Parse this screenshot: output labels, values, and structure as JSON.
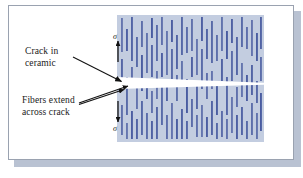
{
  "figure": {
    "type": "technical-illustration",
    "background_color": "#ffffff",
    "frame": {
      "border_color": "#9aa2b0",
      "shadow_color": "#b9c2d2"
    }
  },
  "labels": {
    "crack": {
      "line1": "Crack in",
      "line2": "ceramic"
    },
    "fibers": {
      "line1": "Fibers extend",
      "line2": "across crack"
    }
  },
  "stress_markers": {
    "top": {
      "symbol": "σ",
      "direction": "up",
      "meaning": "applied tensile stress"
    },
    "bottom": {
      "symbol": "σ",
      "direction": "down",
      "meaning": "applied tensile stress"
    }
  },
  "composite_block": {
    "matrix_color": "#c3cde0",
    "fiber_color": "#42559c",
    "fiber_orientation": "vertical",
    "crack_color": "#ffffff",
    "crack_shape": "wedge tapering left-to-right",
    "fibers": [
      {
        "x": 4,
        "y": 3,
        "h": 34
      },
      {
        "x": 4,
        "y": 44,
        "h": 26
      },
      {
        "x": 4,
        "y": 90,
        "h": 30
      },
      {
        "x": 9,
        "y": 14,
        "h": 22
      },
      {
        "x": 9,
        "y": 62,
        "h": 38
      },
      {
        "x": 9,
        "y": 108,
        "h": 16
      },
      {
        "x": 14,
        "y": 2,
        "h": 44
      },
      {
        "x": 14,
        "y": 52,
        "h": 20
      },
      {
        "x": 14,
        "y": 96,
        "h": 28
      },
      {
        "x": 19,
        "y": 22,
        "h": 30
      },
      {
        "x": 19,
        "y": 70,
        "h": 24
      },
      {
        "x": 19,
        "y": 104,
        "h": 20
      },
      {
        "x": 24,
        "y": 6,
        "h": 26
      },
      {
        "x": 24,
        "y": 40,
        "h": 36
      },
      {
        "x": 24,
        "y": 86,
        "h": 34
      },
      {
        "x": 29,
        "y": 18,
        "h": 40
      },
      {
        "x": 29,
        "y": 66,
        "h": 18
      },
      {
        "x": 29,
        "y": 98,
        "h": 26
      },
      {
        "x": 34,
        "y": 3,
        "h": 20
      },
      {
        "x": 34,
        "y": 30,
        "h": 32
      },
      {
        "x": 34,
        "y": 76,
        "h": 22
      },
      {
        "x": 34,
        "y": 106,
        "h": 18
      },
      {
        "x": 39,
        "y": 10,
        "h": 36
      },
      {
        "x": 39,
        "y": 56,
        "h": 28
      },
      {
        "x": 39,
        "y": 92,
        "h": 32
      },
      {
        "x": 44,
        "y": 2,
        "h": 28
      },
      {
        "x": 44,
        "y": 38,
        "h": 24
      },
      {
        "x": 44,
        "y": 70,
        "h": 40
      },
      {
        "x": 49,
        "y": 16,
        "h": 44
      },
      {
        "x": 49,
        "y": 66,
        "h": 20
      },
      {
        "x": 49,
        "y": 100,
        "h": 24
      },
      {
        "x": 54,
        "y": 5,
        "h": 22
      },
      {
        "x": 54,
        "y": 34,
        "h": 30
      },
      {
        "x": 54,
        "y": 88,
        "h": 36
      },
      {
        "x": 59,
        "y": 20,
        "h": 34
      },
      {
        "x": 59,
        "y": 60,
        "h": 26
      },
      {
        "x": 59,
        "y": 104,
        "h": 20
      },
      {
        "x": 64,
        "y": 2,
        "h": 38
      },
      {
        "x": 64,
        "y": 46,
        "h": 22
      },
      {
        "x": 64,
        "y": 94,
        "h": 30
      },
      {
        "x": 69,
        "y": 12,
        "h": 26
      },
      {
        "x": 69,
        "y": 64,
        "h": 34
      },
      {
        "x": 69,
        "y": 106,
        "h": 18
      },
      {
        "x": 74,
        "y": 4,
        "h": 32
      },
      {
        "x": 74,
        "y": 42,
        "h": 20
      },
      {
        "x": 74,
        "y": 84,
        "h": 28
      },
      {
        "x": 79,
        "y": 24,
        "h": 36
      },
      {
        "x": 79,
        "y": 70,
        "h": 24
      },
      {
        "x": 79,
        "y": 100,
        "h": 22
      },
      {
        "x": 84,
        "y": 2,
        "h": 24
      },
      {
        "x": 84,
        "y": 34,
        "h": 40
      },
      {
        "x": 84,
        "y": 90,
        "h": 32
      },
      {
        "x": 89,
        "y": 14,
        "h": 30
      },
      {
        "x": 89,
        "y": 58,
        "h": 26
      },
      {
        "x": 89,
        "y": 102,
        "h": 20
      },
      {
        "x": 94,
        "y": 6,
        "h": 42
      },
      {
        "x": 94,
        "y": 56,
        "h": 18
      },
      {
        "x": 94,
        "y": 86,
        "h": 34
      },
      {
        "x": 99,
        "y": 20,
        "h": 26
      },
      {
        "x": 99,
        "y": 68,
        "h": 32
      },
      {
        "x": 99,
        "y": 108,
        "h": 16
      },
      {
        "x": 104,
        "y": 2,
        "h": 34
      },
      {
        "x": 104,
        "y": 44,
        "h": 22
      },
      {
        "x": 104,
        "y": 96,
        "h": 26
      },
      {
        "x": 109,
        "y": 16,
        "h": 28
      },
      {
        "x": 109,
        "y": 62,
        "h": 38
      },
      {
        "x": 109,
        "y": 104,
        "h": 20
      },
      {
        "x": 114,
        "y": 4,
        "h": 24
      },
      {
        "x": 114,
        "y": 36,
        "h": 30
      },
      {
        "x": 114,
        "y": 82,
        "h": 36
      },
      {
        "x": 119,
        "y": 22,
        "h": 38
      },
      {
        "x": 119,
        "y": 72,
        "h": 20
      },
      {
        "x": 119,
        "y": 100,
        "h": 24
      },
      {
        "x": 124,
        "y": 2,
        "h": 30
      },
      {
        "x": 124,
        "y": 48,
        "h": 34
      },
      {
        "x": 124,
        "y": 92,
        "h": 28
      },
      {
        "x": 129,
        "y": 12,
        "h": 22
      },
      {
        "x": 129,
        "y": 60,
        "h": 26
      },
      {
        "x": 129,
        "y": 106,
        "h": 18
      },
      {
        "x": 134,
        "y": 5,
        "h": 36
      },
      {
        "x": 134,
        "y": 50,
        "h": 30
      },
      {
        "x": 134,
        "y": 88,
        "h": 32
      },
      {
        "x": 139,
        "y": 18,
        "h": 28
      },
      {
        "x": 139,
        "y": 66,
        "h": 22
      },
      {
        "x": 139,
        "y": 98,
        "h": 26
      },
      {
        "x": 143,
        "y": 2,
        "h": 32
      },
      {
        "x": 143,
        "y": 42,
        "h": 24
      },
      {
        "x": 143,
        "y": 78,
        "h": 38
      }
    ]
  }
}
